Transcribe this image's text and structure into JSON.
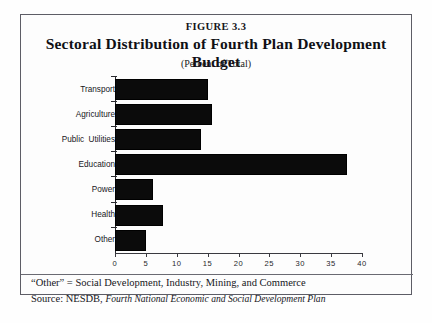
{
  "figure": {
    "number": "FIGURE 3.3",
    "title": "Sectoral Distribution of Fourth Plan Development Budget",
    "subtitle": "(Percent of Total)"
  },
  "notes": {
    "other_note": "“Other” = Social Development, Industry, Mining, and Commerce",
    "source_prefix": "Source: NESDB,",
    "source_italic": "Fourth National Economic and Social Development Plan"
  },
  "chart_data": {
    "type": "bar",
    "orientation": "horizontal",
    "title": "Sectoral Distribution of Fourth Plan Development Budget",
    "subtitle": "(Percent of Total)",
    "xlabel": "",
    "ylabel": "",
    "xlim": [
      0,
      40
    ],
    "xticks": [
      0,
      5,
      10,
      15,
      20,
      25,
      30,
      35,
      40
    ],
    "xtick_labels": [
      "0",
      "5",
      "10",
      "15",
      "20",
      "25",
      "30",
      "35",
      "40"
    ],
    "grid": false,
    "legend": false,
    "bar_color": "#0b0b0b",
    "categories": [
      "Transport",
      "Agriculture",
      "Public  Utilities",
      "Education",
      "Power",
      "Health",
      "Other"
    ],
    "values": [
      15.0,
      15.7,
      14.0,
      37.5,
      6.2,
      7.7,
      5.0
    ]
  }
}
